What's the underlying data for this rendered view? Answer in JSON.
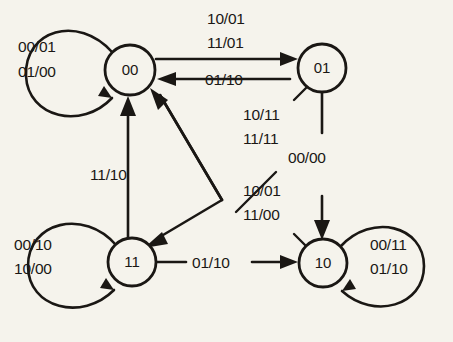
{
  "diagram": {
    "type": "finite-state-machine",
    "background_color": "#f5f3ec",
    "ink_color": "#1a1714",
    "label_format": "input/output",
    "states": [
      {
        "id": "s00",
        "name": "00",
        "cx": 130,
        "cy": 70,
        "r": 25
      },
      {
        "id": "s01",
        "name": "01",
        "cx": 322,
        "cy": 68,
        "r": 24
      },
      {
        "id": "s11",
        "name": "11",
        "cx": 132,
        "cy": 262,
        "r": 24
      },
      {
        "id": "s10",
        "name": "10",
        "cx": 323,
        "cy": 263,
        "r": 24
      }
    ],
    "transitions": [
      {
        "id": "t-00-self",
        "from": "00",
        "to": "00",
        "kind": "self-loop",
        "side": "left",
        "labels": [
          "00/01",
          "01/00"
        ],
        "label_x": 18,
        "label_y": 52
      },
      {
        "id": "t-00-01",
        "from": "00",
        "to": "01",
        "kind": "straight",
        "labels": [
          "10/01",
          "11/01"
        ],
        "label_x": 207,
        "label_y": 24
      },
      {
        "id": "t-01-00",
        "from": "01",
        "to": "00",
        "kind": "straight",
        "labels": [
          "01/10"
        ],
        "label_x": 205,
        "label_y": 82
      },
      {
        "id": "t-01-11",
        "from": "01",
        "to": "11",
        "kind": "diagonal-cut",
        "labels": [
          "10/11",
          "11/11"
        ],
        "label_x": 243,
        "label_y": 118
      },
      {
        "id": "t-11-00",
        "from": "11",
        "to": "00",
        "kind": "vertical",
        "labels": [
          "11/10"
        ],
        "label_x": 90,
        "label_y": 175
      },
      {
        "id": "t-11-10-diag",
        "from": "11",
        "to": "10",
        "kind": "diagonal-cut",
        "labels": [
          "10/01",
          "11/00"
        ],
        "label_x": 243,
        "label_y": 194
      },
      {
        "id": "t-01-10",
        "from": "01",
        "to": "10",
        "kind": "vertical",
        "labels": [
          "00/00"
        ],
        "label_x": 288,
        "label_y": 158
      },
      {
        "id": "t-11-self",
        "from": "11",
        "to": "11",
        "kind": "self-loop",
        "side": "left",
        "labels": [
          "00/10",
          "10/00"
        ],
        "label_x": 14,
        "label_y": 245
      },
      {
        "id": "t-11-10",
        "from": "11",
        "to": "10",
        "kind": "straight",
        "labels": [
          "01/10"
        ],
        "label_x": 201,
        "label_y": 258
      },
      {
        "id": "t-10-self",
        "from": "10",
        "to": "10",
        "kind": "self-loop",
        "side": "right",
        "labels": [
          "00/11",
          "01/10"
        ],
        "label_x": 375,
        "label_y": 245
      }
    ]
  }
}
